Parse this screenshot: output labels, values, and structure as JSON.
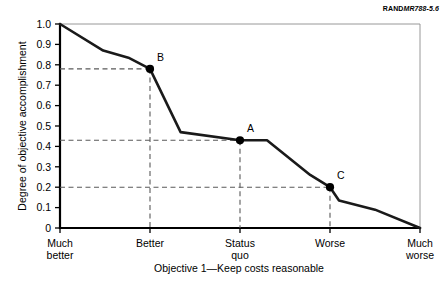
{
  "source_tag": {
    "brand": "RAND",
    "id": "MR788-5.6"
  },
  "chart_data": {
    "type": "line",
    "title": "",
    "xlabel": "Objective 1—Keep costs reasonable",
    "ylabel": "Degree of objective accomplishment",
    "ylim": [
      0,
      1.0
    ],
    "xlim": [
      0,
      1.0
    ],
    "grid": false,
    "legend": null,
    "ytick_labels": [
      "0",
      "0.1",
      "0.2",
      "0.3",
      "0.4",
      "0.5",
      "0.6",
      "0.7",
      "0.8",
      "0.9",
      "1.0"
    ],
    "ytick_values": [
      0,
      0.1,
      0.2,
      0.3,
      0.4,
      0.5,
      0.6,
      0.7,
      0.8,
      0.9,
      1.0
    ],
    "categories": [
      "Much better",
      "Better",
      "Status quo",
      "Worse",
      "Much worse"
    ],
    "category_lines": [
      [
        "Much",
        "better"
      ],
      [
        "Better"
      ],
      [
        "Status",
        "quo"
      ],
      [
        "Worse"
      ],
      [
        "Much",
        "worse"
      ]
    ],
    "category_positions": [
      0.0,
      0.25,
      0.5,
      0.75,
      1.0
    ],
    "series": [
      {
        "name": "Objective 1 value function",
        "x": [
          0.0,
          0.12,
          0.19,
          0.25,
          0.335,
          0.5,
          0.575,
          0.695,
          0.75,
          0.775,
          0.875,
          1.0
        ],
        "y": [
          1.0,
          0.87,
          0.835,
          0.78,
          0.47,
          0.43,
          0.43,
          0.26,
          0.2,
          0.135,
          0.09,
          0.0
        ]
      }
    ],
    "annotated_points": [
      {
        "label": "B",
        "x": 0.25,
        "y": 0.78
      },
      {
        "label": "A",
        "x": 0.5,
        "y": 0.43
      },
      {
        "label": "C",
        "x": 0.75,
        "y": 0.2
      }
    ]
  }
}
